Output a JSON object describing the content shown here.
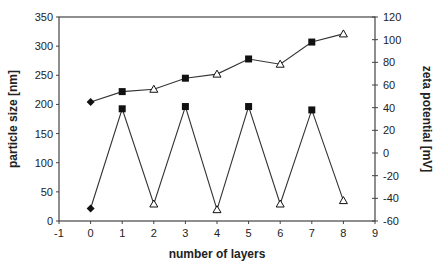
{
  "chart_data": {
    "type": "line",
    "title": "",
    "xlabel": "number of layers",
    "ylabel": "particle size [nm]",
    "y2label": "zeta potential [mV]",
    "xlim": [
      -1,
      9
    ],
    "ylim": [
      0,
      350
    ],
    "y2lim": [
      -60,
      120
    ],
    "x_ticks": [
      "-1",
      "0",
      "1",
      "2",
      "3",
      "4",
      "5",
      "6",
      "7",
      "8",
      "9"
    ],
    "y_ticks": [
      "0",
      "50",
      "100",
      "150",
      "200",
      "250",
      "300",
      "350"
    ],
    "y2_ticks": [
      "-60",
      "-40",
      "-20",
      "0",
      "20",
      "40",
      "60",
      "80",
      "100",
      "120"
    ],
    "grid": false,
    "legend": "none",
    "x": [
      0,
      1,
      2,
      3,
      4,
      5,
      6,
      7,
      8
    ],
    "markers": [
      "diamond",
      "square",
      "triangle-open",
      "square",
      "triangle-open",
      "square",
      "triangle-open",
      "square",
      "triangle-open"
    ],
    "series": [
      {
        "name": "particle size",
        "axis": "left",
        "values": [
          204,
          222,
          226,
          245,
          252,
          278,
          269,
          307,
          321
        ]
      },
      {
        "name": "zeta potential",
        "axis": "right",
        "values": [
          -49,
          39,
          -45,
          41,
          -50,
          41,
          -45,
          38,
          -42
        ]
      }
    ]
  },
  "colors": {
    "line": "#333333",
    "axis": "#444444",
    "marker_fill": "#111111"
  }
}
